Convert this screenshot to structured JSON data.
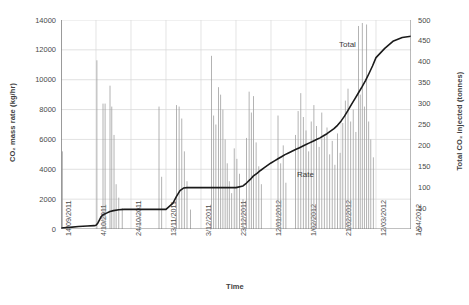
{
  "axes": {
    "y_left": {
      "title": "CO₂ mass rate (kg/hr)",
      "ticks": [
        "0",
        "2000",
        "4000",
        "6000",
        "8000",
        "10000",
        "12000",
        "14000"
      ],
      "min": 0,
      "max": 14000
    },
    "y_right": {
      "title": "Total CO₂ injected (tonnes)",
      "ticks": [
        "0",
        "50",
        "100",
        "150",
        "200",
        "250",
        "300",
        "350",
        "400",
        "450",
        "500"
      ],
      "min": 0,
      "max": 500
    },
    "x": {
      "title": "Time",
      "ticks": [
        "14/09/2011",
        "4/10/2011",
        "24/10/2011",
        "13/11/2011",
        "3/12/2011",
        "23/12/2011",
        "12/01/2012",
        "1/02/2012",
        "21/02/2012",
        "12/03/2012",
        "1/04/2012"
      ]
    }
  },
  "annotations": {
    "total_label": "Total",
    "rate_label": "Rate"
  },
  "colors": {
    "total_line": "#1a1a1a",
    "rate_line": "#9a9a9a",
    "grid": "#d9d9d9",
    "axis": "#808080",
    "text": "#4a4a4a"
  },
  "chart_data": {
    "type": "line",
    "title": "",
    "xlabel": "Time",
    "ylabel": "CO₂ mass rate (kg/hr)",
    "y2label": "Total CO₂ injected (tonnes)",
    "xlim": [
      0,
      200
    ],
    "ylim": [
      0,
      14000
    ],
    "y2lim": [
      0,
      500
    ],
    "grid": true,
    "legend": "inline-annotation",
    "x_tick_positions": [
      0,
      20,
      40,
      60,
      80,
      100,
      120,
      140,
      160,
      180,
      200
    ],
    "x_tick_labels": [
      "14/09/2011",
      "4/10/2011",
      "24/10/2011",
      "13/11/2011",
      "3/12/2011",
      "23/12/2011",
      "12/01/2012",
      "1/02/2012",
      "21/02/2012",
      "12/03/2012",
      "1/04/2012"
    ],
    "series": [
      {
        "name": "Total",
        "axis": "right",
        "unit": "tonnes",
        "type": "step-cumulative",
        "x": [
          0,
          5,
          10,
          15,
          19,
          20,
          21,
          22,
          23,
          24,
          26,
          28,
          30,
          33,
          36,
          40,
          44,
          48,
          52,
          56,
          60,
          64,
          66,
          68,
          70,
          72,
          74,
          76,
          78,
          80,
          84,
          88,
          92,
          96,
          100,
          104,
          106,
          108,
          110,
          112,
          114,
          116,
          118,
          120,
          122,
          124,
          126,
          128,
          130,
          132,
          134,
          136,
          138,
          140,
          142,
          144,
          146,
          148,
          150,
          152,
          154,
          156,
          158,
          160,
          162,
          164,
          166,
          168,
          170,
          172,
          174,
          176,
          178,
          180,
          185,
          190,
          195,
          200
        ],
        "values": [
          2,
          4,
          6,
          7,
          8,
          9,
          14,
          22,
          30,
          34,
          38,
          42,
          44,
          46,
          47,
          47,
          47,
          47,
          47,
          47,
          47,
          62,
          78,
          92,
          98,
          99,
          99,
          99,
          99,
          99,
          99,
          99,
          99,
          99,
          99,
          103,
          110,
          118,
          127,
          133,
          140,
          146,
          152,
          158,
          163,
          168,
          173,
          178,
          182,
          186,
          190,
          194,
          198,
          202,
          206,
          210,
          214,
          218,
          223,
          228,
          234,
          240,
          248,
          258,
          270,
          284,
          298,
          312,
          326,
          340,
          355,
          372,
          390,
          410,
          432,
          450,
          458,
          461
        ]
      },
      {
        "name": "Rate",
        "axis": "left",
        "unit": "kg/hr",
        "type": "spikes",
        "description": "Intermittent vertical spikes of instantaneous CO2 mass rate",
        "spikes": [
          {
            "x": 0.3,
            "y": 14300
          },
          {
            "x": 0.8,
            "y": 5200
          },
          {
            "x": 20.5,
            "y": 11300
          },
          {
            "x": 24.0,
            "y": 8400
          },
          {
            "x": 25.2,
            "y": 8400
          },
          {
            "x": 28.0,
            "y": 9600
          },
          {
            "x": 29.0,
            "y": 8200
          },
          {
            "x": 30.3,
            "y": 6300
          },
          {
            "x": 31.5,
            "y": 3000
          },
          {
            "x": 33.0,
            "y": 2100
          },
          {
            "x": 35.0,
            "y": 1400
          },
          {
            "x": 45.0,
            "y": 1500
          },
          {
            "x": 56.0,
            "y": 8200
          },
          {
            "x": 57.5,
            "y": 3500
          },
          {
            "x": 66.0,
            "y": 8300
          },
          {
            "x": 67.5,
            "y": 8200
          },
          {
            "x": 69.0,
            "y": 7400
          },
          {
            "x": 70.5,
            "y": 5200
          },
          {
            "x": 72.0,
            "y": 3200
          },
          {
            "x": 74.0,
            "y": 1300
          },
          {
            "x": 86.0,
            "y": 11600
          },
          {
            "x": 87.2,
            "y": 7600
          },
          {
            "x": 88.5,
            "y": 7000
          },
          {
            "x": 90.0,
            "y": 9500
          },
          {
            "x": 91.2,
            "y": 9000
          },
          {
            "x": 92.5,
            "y": 8000
          },
          {
            "x": 93.8,
            "y": 6000
          },
          {
            "x": 95.0,
            "y": 4400
          },
          {
            "x": 96.2,
            "y": 3200
          },
          {
            "x": 97.5,
            "y": 2400
          },
          {
            "x": 99.0,
            "y": 5400
          },
          {
            "x": 100.5,
            "y": 4700
          },
          {
            "x": 102.0,
            "y": 3700
          },
          {
            "x": 104.0,
            "y": 2000
          },
          {
            "x": 106.0,
            "y": 6100
          },
          {
            "x": 107.5,
            "y": 9200
          },
          {
            "x": 108.8,
            "y": 7800
          },
          {
            "x": 110.0,
            "y": 8900
          },
          {
            "x": 111.5,
            "y": 5800
          },
          {
            "x": 113.0,
            "y": 4200
          },
          {
            "x": 114.5,
            "y": 3000
          },
          {
            "x": 124.0,
            "y": 7600
          },
          {
            "x": 125.5,
            "y": 4400
          },
          {
            "x": 127.0,
            "y": 5600
          },
          {
            "x": 128.5,
            "y": 3100
          },
          {
            "x": 134.0,
            "y": 6300
          },
          {
            "x": 135.5,
            "y": 7900
          },
          {
            "x": 137.0,
            "y": 9100
          },
          {
            "x": 138.5,
            "y": 7500
          },
          {
            "x": 140.0,
            "y": 6600
          },
          {
            "x": 141.5,
            "y": 5200
          },
          {
            "x": 143.0,
            "y": 7200
          },
          {
            "x": 144.5,
            "y": 8300
          },
          {
            "x": 146.0,
            "y": 6900
          },
          {
            "x": 147.5,
            "y": 5500
          },
          {
            "x": 149.0,
            "y": 7800
          },
          {
            "x": 150.5,
            "y": 6200
          },
          {
            "x": 152.0,
            "y": 6800
          },
          {
            "x": 153.5,
            "y": 5000
          },
          {
            "x": 155.0,
            "y": 5900
          },
          {
            "x": 156.5,
            "y": 4300
          },
          {
            "x": 158.0,
            "y": 6400
          },
          {
            "x": 159.5,
            "y": 5100
          },
          {
            "x": 161.0,
            "y": 7100
          },
          {
            "x": 162.5,
            "y": 8600
          },
          {
            "x": 164.0,
            "y": 9400
          },
          {
            "x": 165.5,
            "y": 7200
          },
          {
            "x": 167.0,
            "y": 8000
          },
          {
            "x": 168.5,
            "y": 6500
          },
          {
            "x": 170.0,
            "y": 13600
          },
          {
            "x": 171.0,
            "y": 9000
          },
          {
            "x": 172.2,
            "y": 13800
          },
          {
            "x": 173.4,
            "y": 8200
          },
          {
            "x": 174.6,
            "y": 13700
          },
          {
            "x": 175.8,
            "y": 7200
          },
          {
            "x": 177.0,
            "y": 6000
          },
          {
            "x": 178.5,
            "y": 4800
          }
        ]
      }
    ]
  }
}
